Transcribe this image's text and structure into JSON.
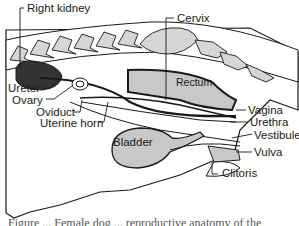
{
  "diagram": {
    "labels": {
      "right_kidney": "Right kidney",
      "cervix": "Cervix",
      "ureter": "Ureter",
      "ovary": "Ovary",
      "rectum": "Rectum",
      "vagina": "Vagina",
      "oviduct": "Oviduct",
      "urethra": "Urethra",
      "uterine_horn": "Uterine horn",
      "vestibule": "Vestibule",
      "bladder": "Bladder",
      "vulva": "Vulva",
      "clitoris": "Clitoris"
    },
    "caption": "Figure ... Female dog ... reproductive anatomy of the"
  },
  "colors": {
    "outline": "#1a1a1a",
    "fill_gray": "#c8c8c8",
    "kidney": "#333333",
    "bone": "#d6d6d6",
    "background": "#ffffff"
  }
}
